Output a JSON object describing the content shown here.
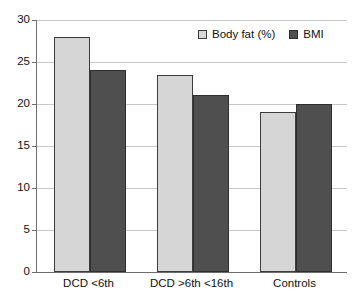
{
  "chart_data": {
    "type": "bar",
    "title": "",
    "xlabel": "",
    "ylabel": "",
    "ylim": [
      0,
      30
    ],
    "ytick_step": 5,
    "yticks": [
      30,
      25,
      20,
      15,
      10,
      5,
      0
    ],
    "grid": true,
    "legend_position": "top-right",
    "categories": [
      "DCD <6th",
      "DCD >6th <16th",
      "Controls"
    ],
    "series": [
      {
        "name": "Body fat (%)",
        "values": [
          28,
          23.5,
          19
        ],
        "color": "#d6d6d6"
      },
      {
        "name": "BMI",
        "values": [
          24,
          21.1,
          20
        ],
        "color": "#4f4f4f"
      }
    ]
  },
  "legend": {
    "items": [
      {
        "label": "Body fat (%)",
        "swatch": "light-gray-square-icon"
      },
      {
        "label": "BMI",
        "swatch": "dark-gray-square-icon"
      }
    ]
  },
  "axis": {
    "y_tick_labels": [
      "30",
      "25",
      "20",
      "15",
      "10",
      "5",
      "0"
    ],
    "x_tick_labels": [
      "DCD <6th",
      "DCD >6th <16th",
      "Controls"
    ]
  },
  "colors": {
    "series_light": "#d6d6d6",
    "series_dark": "#4f4f4f",
    "gridline": "#c9c9c9",
    "axis": "#6d6d6d",
    "text": "#111111",
    "background": "#ffffff"
  }
}
